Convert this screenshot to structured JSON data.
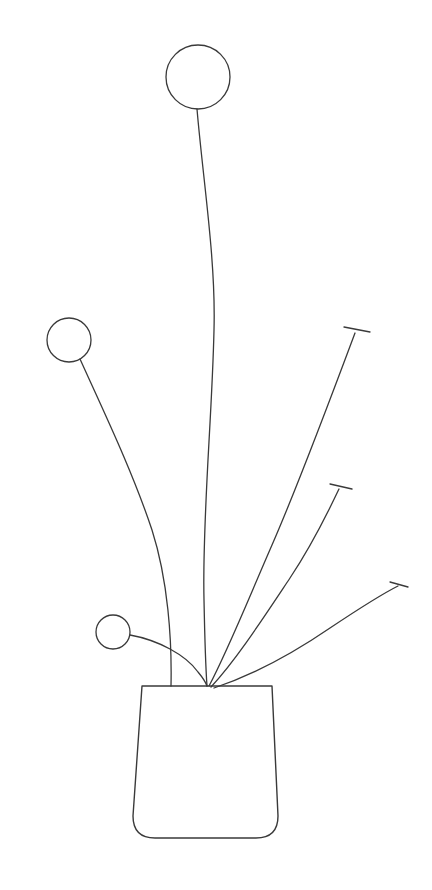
{
  "artwork": {
    "title": "Potted Plant Line Drawing",
    "subject": "houseplant-in-pot",
    "style": "minimal-line-art",
    "background_color": "#ffffff",
    "stroke_color": "#3a3a3a",
    "stroke_width": 1.3,
    "canvas": {
      "width": 432,
      "height": 890
    }
  },
  "pot": {
    "label": "Plant Pot",
    "shape": "tapered-trapezoid-rounded-base",
    "top_left_x": 142,
    "top_right_x": 272,
    "top_y": 686,
    "bottom_left_x": 133,
    "bottom_right_x": 278,
    "bottom_y": 838,
    "corner_radius": 22,
    "path": "M 142 686 L 272 686 L 278 816 Q 278 838 256 838 L 155 838 Q 133 838 133 816 Z"
  },
  "stem_origin": {
    "x": 208,
    "y": 686
  },
  "flowers": [
    {
      "name": "top-flower",
      "label": "Tall Center Flower",
      "head": {
        "cx": 198,
        "cy": 77,
        "r": 32
      },
      "stem_path": "M 197 109 C 203 180 216 260 214 330 C 212 420 202 520 204 600 C 205 650 206 672 207 686"
    },
    {
      "name": "left-flower",
      "label": "Left Flower",
      "head": {
        "cx": 69,
        "cy": 340,
        "r": 22
      },
      "stem_path": "M 80 359 C 103 410 132 470 152 530 C 168 580 172 640 171 686"
    },
    {
      "name": "small-flower",
      "label": "Small Low Flower",
      "head": {
        "cx": 113,
        "cy": 632,
        "r": 17
      },
      "stem_path": "M 130 635 C 158 640 186 655 198 672 C 203 678 206 683 207 686"
    }
  ],
  "buds": [
    {
      "name": "upper-right-bud",
      "label": "Upper Right Bud Stem",
      "stem_path": "M 209 686 C 228 650 248 600 272 545 C 296 490 330 400 355 333",
      "tip": {
        "x": 355,
        "y": 333
      },
      "cap_path": "M 344 327 L 370 332"
    },
    {
      "name": "middle-right-bud",
      "label": "Middle Right Bud Stem",
      "stem_path": "M 211 687 C 236 660 262 620 290 578 C 314 542 330 508 339 489",
      "tip": {
        "x": 339,
        "y": 489
      },
      "cap_path": "M 330 484 L 352 489"
    },
    {
      "name": "lower-right-bud",
      "label": "Lower Right Bud Stem",
      "stem_path": "M 214 688 C 250 676 292 654 330 628 C 366 604 388 591 398 586",
      "tip": {
        "x": 398,
        "y": 586
      },
      "cap_path": "M 390 582 L 408 587"
    }
  ],
  "counts": {
    "flower_heads": 3,
    "bud_stems": 3,
    "total_stems": 6
  }
}
